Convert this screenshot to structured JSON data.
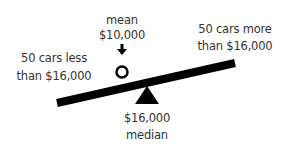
{
  "labels": {
    "mean_title": "mean",
    "mean_value": "$10,000",
    "left_line1": "50 cars less",
    "left_line2": "than $16,000",
    "right_line1": "50 cars more",
    "right_line2": "than $16,000",
    "median_value": "$16,000",
    "median_title": "median"
  },
  "colors": {
    "ink": "#000000",
    "text": "#333333",
    "background": "#ffffff"
  },
  "icons": {
    "mean_pointer": "down-arrow-icon",
    "mean_marker": "hollow-circle-icon",
    "fulcrum": "triangle-fulcrum-icon"
  }
}
